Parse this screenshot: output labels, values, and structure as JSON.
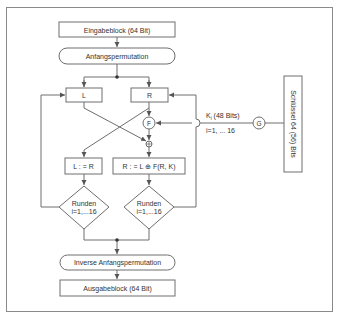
{
  "diagram": {
    "colors": {
      "stroke": "#6e6e6e",
      "text": "#333333",
      "frame": "#8a8a8a",
      "background": "#ffffff"
    },
    "nodes": {
      "input_block": {
        "label": "Eingabeblock (64 Bit)",
        "shape": "rectangle"
      },
      "initial_permutation": {
        "label": "Anfangspermutation",
        "shape": "rounded-rectangle"
      },
      "left_half": {
        "label": "L",
        "shape": "rectangle"
      },
      "right_half": {
        "label": "R",
        "shape": "rectangle"
      },
      "f_function": {
        "label": "F",
        "shape": "circle"
      },
      "xor": {
        "label": "⊕",
        "shape": "circle"
      },
      "assign_left": {
        "label": "L : = R",
        "shape": "rectangle"
      },
      "assign_right": {
        "label": "R : = L ⊕ F(R, K)",
        "shape": "rectangle"
      },
      "rounds_left": {
        "line1": "Runden",
        "line2": "i=1,...16",
        "shape": "diamond"
      },
      "rounds_right": {
        "line1": "Runden",
        "line2": "i=1,...16",
        "shape": "diamond"
      },
      "inverse_permutation": {
        "label": "Inverse Anfangspermutation",
        "shape": "rounded-rectangle"
      },
      "output_block": {
        "label": "Ausgabeblock (64 Bit)",
        "shape": "rectangle"
      },
      "key_generator": {
        "label": "G",
        "shape": "circle"
      },
      "key": {
        "label": "Schlüssel 64 (56) Bits",
        "shape": "rectangle",
        "orientation": "vertical"
      }
    },
    "edge_labels": {
      "subkey_main": "K",
      "subkey_sub": "i",
      "subkey_rest": " (48 Bits)",
      "subkey_range": "i=1, ... 16"
    },
    "edges": [
      {
        "from": "input_block",
        "to": "initial_permutation"
      },
      {
        "from": "initial_permutation",
        "to": "left_half"
      },
      {
        "from": "initial_permutation",
        "to": "right_half"
      },
      {
        "from": "right_half",
        "to": "f_function"
      },
      {
        "from": "f_function",
        "to": "xor"
      },
      {
        "from": "left_half",
        "to": "xor"
      },
      {
        "from": "right_half",
        "to": "assign_left"
      },
      {
        "from": "xor",
        "to": "assign_right"
      },
      {
        "from": "assign_left",
        "to": "rounds_left"
      },
      {
        "from": "assign_right",
        "to": "rounds_right"
      },
      {
        "from": "rounds_left",
        "to": "left_half",
        "label": "loop"
      },
      {
        "from": "rounds_right",
        "to": "right_half",
        "label": "loop"
      },
      {
        "from": "rounds_left",
        "to": "inverse_permutation"
      },
      {
        "from": "rounds_right",
        "to": "inverse_permutation"
      },
      {
        "from": "inverse_permutation",
        "to": "output_block"
      },
      {
        "from": "key",
        "to": "key_generator"
      },
      {
        "from": "key_generator",
        "to": "f_function",
        "label": "Ki (48 Bits), i=1, ... 16"
      }
    ]
  }
}
